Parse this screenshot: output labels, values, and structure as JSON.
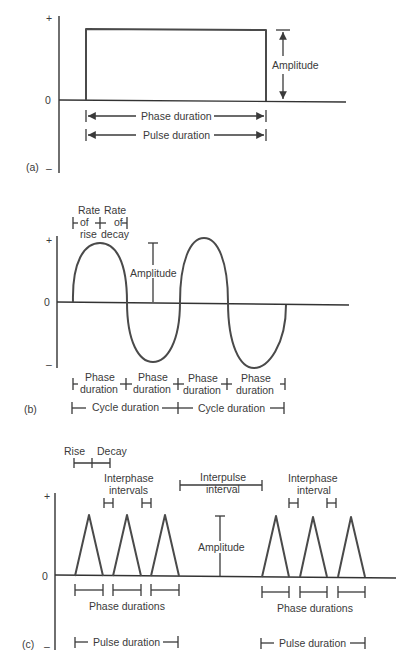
{
  "panels": {
    "a": {
      "label": "(a)",
      "axis": {
        "plus": "+",
        "zero": "0",
        "minus": "–"
      },
      "amplitude_label": "Amplitude",
      "phase_duration_label": "Phase duration",
      "pulse_duration_label": "Pulse duration"
    },
    "b": {
      "label": "(b)",
      "axis": {
        "plus": "+",
        "zero": "0",
        "minus": "–"
      },
      "rate_of_rise": [
        "Rate",
        "of",
        "rise"
      ],
      "rate_of_decay": [
        "Rate",
        "of",
        "decay"
      ],
      "amplitude_label": "Amplitude",
      "phase_durations": [
        [
          "Phase",
          "duration"
        ],
        [
          "Phase",
          "duration"
        ],
        [
          "Phase",
          "duration"
        ],
        [
          "Phase",
          "duration"
        ]
      ],
      "cycle_durations": [
        "Cycle duration",
        "Cycle duration"
      ]
    },
    "c": {
      "label": "(c)",
      "axis": {
        "plus": "+",
        "zero": "0",
        "minus": "–"
      },
      "rise_label": "Rise",
      "decay_label": "Decay",
      "interphase_intervals_label": [
        "Interphase",
        "intervals"
      ],
      "interpulse_interval_label": [
        "Interpulse",
        "interval"
      ],
      "interphase_interval_label": [
        "Interphase",
        "interval"
      ],
      "amplitude_label": "Amplitude",
      "phase_durations_left": "Phase durations",
      "phase_durations_right": "Phase durations",
      "pulse_duration_left": "Pulse duration",
      "pulse_duration_right": "Pulse duration"
    }
  },
  "colors": {
    "line": "#3a3a3a",
    "background": "#ffffff"
  }
}
